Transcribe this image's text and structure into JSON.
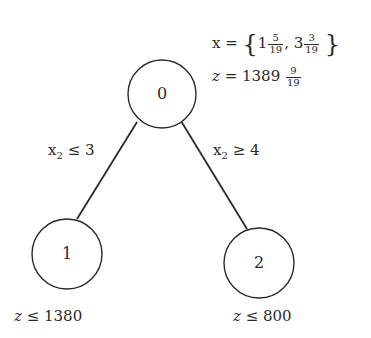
{
  "nodes": [
    {
      "id": "0",
      "label": "0",
      "cx": 162,
      "cy": 94,
      "r": 34
    },
    {
      "id": "1",
      "label": "1",
      "cx": 67,
      "cy": 254,
      "r": 35
    },
    {
      "id": "2",
      "label": "2",
      "cx": 259,
      "cy": 263,
      "r": 35
    }
  ],
  "edges": [
    {
      "from": "0",
      "to": "1",
      "label_var": "x",
      "label_sub": "2",
      "label_rel": "≤ 3"
    },
    {
      "from": "0",
      "to": "2",
      "label_var": "x",
      "label_sub": "2",
      "label_rel": "≥ 4"
    }
  ],
  "root_info": {
    "x_lhs": "x =",
    "x_open": "{",
    "x1_whole": "1",
    "x1_num": "5",
    "x1_den": "19",
    "x_sep": ",",
    "x2_whole": "3",
    "x2_num": "3",
    "x2_den": "19",
    "x_close": "}",
    "z_var": "z",
    "z_eq": "= 1389",
    "z_num": "9",
    "z_den": "19"
  },
  "leaf_info": {
    "node1": {
      "var": "z",
      "rel": "≤ 1380"
    },
    "node2": {
      "var": "z",
      "rel": "≤ 800"
    }
  },
  "colors": {
    "stroke": "#2a2a2a",
    "background": "#ffffff"
  }
}
